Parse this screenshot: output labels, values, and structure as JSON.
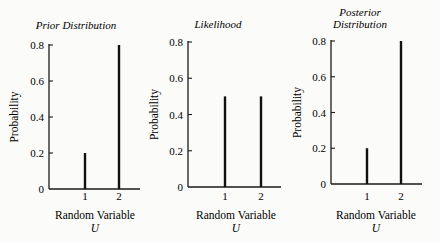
{
  "chart_data": [
    {
      "type": "bar",
      "title": "Prior Distribution",
      "xlabel": "Random Variable",
      "xlabel_symbol": "U",
      "ylabel": "Probability",
      "categories": [
        "1",
        "2"
      ],
      "values": [
        0.2,
        0.8
      ],
      "ylim": [
        0,
        0.8
      ],
      "yticks": [
        "0",
        "0.2",
        "0.4",
        "0.6",
        "0.8"
      ],
      "grid": false,
      "style": "stem"
    },
    {
      "type": "bar",
      "title": "Likelihood",
      "xlabel": "Random Variable",
      "xlabel_symbol": "U",
      "ylabel": "Probability",
      "categories": [
        "1",
        "2"
      ],
      "values": [
        0.5,
        0.5
      ],
      "ylim": [
        0,
        0.8
      ],
      "yticks": [
        "0",
        "0.2",
        "0.4",
        "0.6",
        "0.8"
      ],
      "grid": false,
      "style": "stem"
    },
    {
      "type": "bar",
      "title": "Posterior Distribution",
      "title_lines": [
        "Posterior",
        "Distribution"
      ],
      "xlabel": "Random Variable",
      "xlabel_symbol": "U",
      "ylabel": "Probability",
      "categories": [
        "1",
        "2"
      ],
      "values": [
        0.2,
        0.8
      ],
      "ylim": [
        0,
        0.8
      ],
      "yticks": [
        "0",
        "0.2",
        "0.4",
        "0.6",
        "0.8"
      ],
      "grid": false,
      "style": "stem"
    }
  ],
  "layout": {
    "panels": [
      {
        "axis_x": 49,
        "y0": 189,
        "y08": 45,
        "x_end": 140,
        "bar_x": [
          85,
          119
        ],
        "tick_label_x": 8,
        "title_x": 76,
        "title_y": [
          29
        ],
        "ylabel_x": 18,
        "xlabel_cx": 95
      },
      {
        "axis_x": 188,
        "y0": 187,
        "y08": 42,
        "x_end": 281,
        "bar_x": [
          225,
          261
        ],
        "tick_label_x": 148,
        "title_x": 218,
        "title_y": [
          28
        ],
        "ylabel_x": 158,
        "xlabel_cx": 236
      },
      {
        "axis_x": 331,
        "y0": 184,
        "y08": 41,
        "x_end": 422,
        "bar_x": [
          367,
          401
        ],
        "tick_label_x": 290,
        "title_x": 360,
        "title_y": [
          16,
          28
        ],
        "ylabel_x": 301,
        "xlabel_cx": 376
      }
    ]
  }
}
